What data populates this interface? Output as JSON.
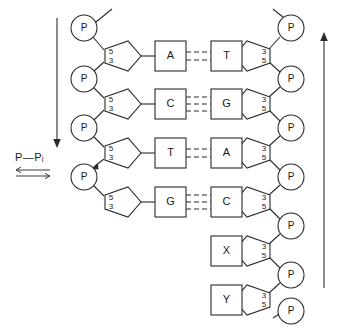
{
  "diagram": {
    "reaction_label": "P—Pᵢ",
    "equilibrium_symbol": "⇌",
    "phosphate_label": "P",
    "sugar_labels_left": {
      "top": "5",
      "bottom": "3"
    },
    "sugar_labels_right": {
      "top": "3",
      "bottom": "5"
    },
    "left_arrow_direction": "down",
    "right_arrow_direction": "up",
    "stroke_color": "#2b2b2b",
    "background_color": "#ffffff",
    "left_strand": {
      "name": "new-strand",
      "bases": [
        "A",
        "C",
        "T",
        "G"
      ],
      "phosphate_count": 4,
      "sugar_count": 4
    },
    "right_strand": {
      "name": "template-strand",
      "bases": [
        "T",
        "G",
        "A",
        "C",
        "X",
        "Y"
      ],
      "phosphate_count": 7,
      "sugar_count": 6
    },
    "base_pairs": [
      {
        "left": "A",
        "right": "T",
        "bonds": 2
      },
      {
        "left": "C",
        "right": "G",
        "bonds": 3
      },
      {
        "left": "T",
        "right": "A",
        "bonds": 2
      },
      {
        "left": "G",
        "right": "C",
        "bonds": 3
      },
      {
        "left": "",
        "right": "X",
        "bonds": 0
      },
      {
        "left": "",
        "right": "Y",
        "bonds": 0
      }
    ]
  }
}
